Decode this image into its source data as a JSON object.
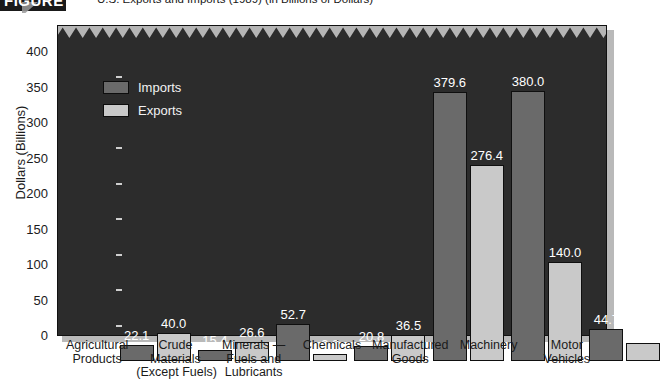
{
  "figure": {
    "number": "FIGURE 18-1",
    "title": "U.S. Exports and Imports (1989) (in Billions of Dollars)"
  },
  "legend": {
    "imports_label": "Imports",
    "exports_label": "Exports",
    "imports_color": "#6a6a6a",
    "exports_color": "#c9c9c9"
  },
  "axis": {
    "y_title": "Dollars (Billions)",
    "y_ticks": [
      "0",
      "50",
      "100",
      "150",
      "200",
      "250",
      "300",
      "350",
      "400"
    ]
  },
  "chart_data": {
    "type": "bar",
    "title": "U.S. Exports and Imports (1989) (in Billions of Dollars)",
    "xlabel": "",
    "ylabel": "Dollars (Billions)",
    "ylim": [
      0,
      420
    ],
    "ytick_step": 50,
    "grid": false,
    "legend_position": "upper-left-inside",
    "categories": [
      "Agricultural Products",
      "Crude Materials (Except Fuels)",
      "Minerals — Fuels and Lubricants",
      "Chemicals",
      "Manufactured Goods",
      "Machinery",
      "Motor Vehicles"
    ],
    "category_lines": [
      [
        "Agricultural",
        "Products"
      ],
      [
        "Crude",
        "Materials",
        "(Except Fuels)"
      ],
      [
        "Minerals —",
        "Fuels and",
        "Lubricants"
      ],
      [
        "Chemicals"
      ],
      [
        "Manufactured",
        "Goods"
      ],
      [
        "Machinery"
      ],
      [
        "Motor",
        "Vehicles"
      ]
    ],
    "series": [
      {
        "name": "Imports",
        "color": "#6a6a6a",
        "values": [
          22.1,
          15.4,
          52.7,
          20.8,
          379.6,
          380.0,
          44.7
        ]
      },
      {
        "name": "Exports",
        "color": "#c9c9c9",
        "values": [
          40.0,
          26.6,
          9.8,
          36.5,
          276.4,
          140.0,
          25.5
        ]
      }
    ],
    "value_labels": [
      [
        "22.1",
        "40.0"
      ],
      [
        "15.4",
        "26.6"
      ],
      [
        "52.7",
        "9.8"
      ],
      [
        "20.8",
        "36.5"
      ],
      [
        "379.6",
        "276.4"
      ],
      [
        "380.0",
        "140.0"
      ],
      [
        "44.7",
        "25.5"
      ]
    ]
  }
}
